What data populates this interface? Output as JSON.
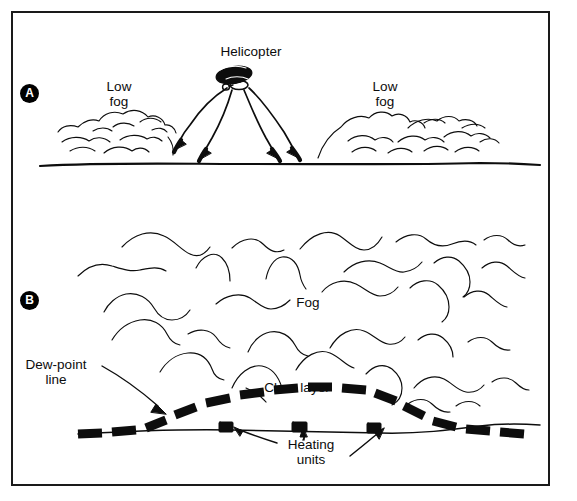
{
  "figure": {
    "border_color": "#1a1a1a",
    "background": "#ffffff",
    "ink_color": "#000000"
  },
  "panels": [
    {
      "badge": "A",
      "caption": "Helicopter mixing dry air down into low fog"
    },
    {
      "badge": "B",
      "caption": "Heating units creating a clear layer beneath the dew-point line"
    }
  ],
  "labels": {
    "helicopter": "Helicopter",
    "low_fog_left": "Low\nfog",
    "low_fog_right": "Low\nfog",
    "fog": "Fog",
    "dew_point_line": "Dew-point\nline",
    "clear_layer": "Clear layer",
    "heating_units": "Heating\nunits"
  },
  "panel_a": {
    "badge": "A",
    "downwash_arrow_count": 4,
    "fog_banks": 2,
    "ground_line": true
  },
  "panel_b": {
    "badge": "B",
    "heating_unit_count": 3,
    "dew_point_line_style": "thick-dashed",
    "fog_wisp_rows": 5,
    "callout_arrows": 4
  }
}
